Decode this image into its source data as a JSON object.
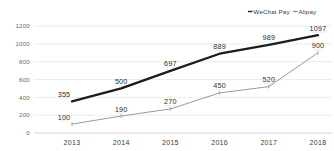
{
  "chart_data": {
    "type": "line",
    "title": "",
    "xlabel": "",
    "ylabel": "",
    "categories": [
      "2013",
      "2014",
      "2015",
      "2016",
      "2017",
      "2018"
    ],
    "yticks": [
      "0",
      "200",
      "400",
      "600",
      "800",
      "1000",
      "1200"
    ],
    "ylim": [
      0,
      1200
    ],
    "grid": true,
    "legend_position": "top-right",
    "series": [
      {
        "name": "WeChat Pay",
        "color": "#1c1c1c",
        "values": [
          355,
          500,
          697,
          889,
          989,
          1097
        ],
        "labels": [
          "355",
          "500",
          "697",
          "889",
          "989",
          "1097"
        ]
      },
      {
        "name": "Alipay",
        "color": "#9a9a9a",
        "values": [
          100,
          190,
          270,
          450,
          520,
          900
        ],
        "labels": [
          "100",
          "190",
          "270",
          "450",
          "520",
          "900"
        ]
      }
    ]
  },
  "legend": {
    "items": [
      {
        "label": "WeChat Pay",
        "marker": "dash-marker",
        "color": "#1c1c1c"
      },
      {
        "label": "Alipay",
        "marker": "dash-marker",
        "color": "#8f8f8f"
      }
    ]
  }
}
